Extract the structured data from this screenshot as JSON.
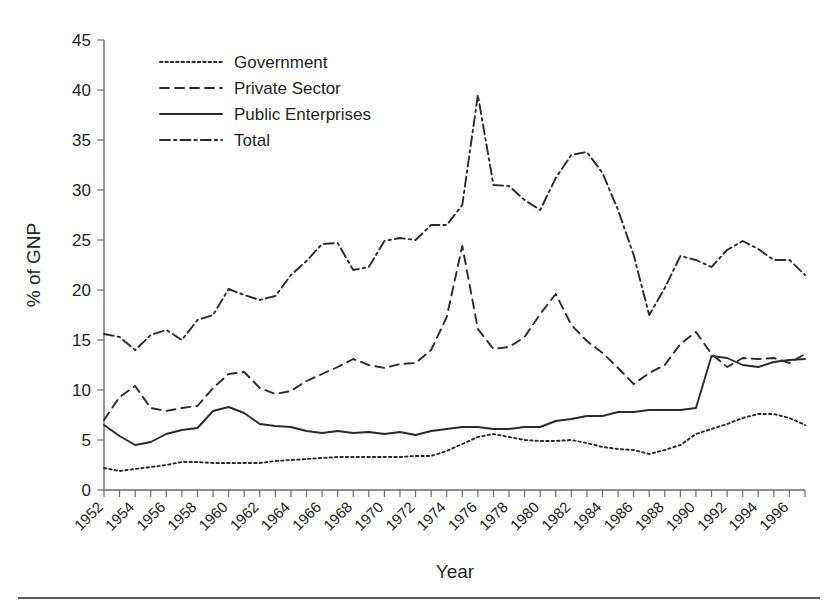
{
  "chart_data": {
    "type": "line",
    "title": "",
    "xlabel": "Year",
    "ylabel": "% of GNP",
    "xlim": [
      1952,
      1997
    ],
    "ylim": [
      0,
      45
    ],
    "yticks": [
      0,
      5,
      10,
      15,
      20,
      25,
      30,
      35,
      40,
      45
    ],
    "grid": false,
    "legend_position": "top-left-inside",
    "x": [
      1952,
      1953,
      1954,
      1955,
      1956,
      1957,
      1958,
      1959,
      1960,
      1961,
      1962,
      1963,
      1964,
      1965,
      1966,
      1967,
      1968,
      1969,
      1970,
      1971,
      1972,
      1973,
      1974,
      1975,
      1976,
      1977,
      1978,
      1979,
      1980,
      1981,
      1982,
      1983,
      1984,
      1985,
      1986,
      1987,
      1988,
      1989,
      1990,
      1991,
      1992,
      1993,
      1994,
      1995,
      1996,
      1997
    ],
    "xtick_labels": [
      "1952",
      "1954",
      "1956",
      "1958",
      "1960",
      "1962",
      "1964",
      "1966",
      "1968",
      "1970",
      "1972",
      "1974",
      "1976",
      "1978",
      "1980",
      "1982",
      "1984",
      "1986",
      "1988",
      "1990",
      "1992",
      "1994",
      "1996"
    ],
    "series": [
      {
        "name": "Government",
        "style": "dotted",
        "values": [
          2.2,
          1.9,
          2.1,
          2.3,
          2.5,
          2.8,
          2.8,
          2.7,
          2.7,
          2.7,
          2.7,
          2.9,
          3.0,
          3.1,
          3.2,
          3.3,
          3.3,
          3.3,
          3.3,
          3.3,
          3.4,
          3.4,
          3.9,
          4.6,
          5.3,
          5.6,
          5.3,
          5.0,
          4.9,
          4.9,
          5.0,
          4.7,
          4.3,
          4.1,
          4.0,
          3.6,
          4.0,
          4.5,
          5.6,
          6.1,
          6.6,
          7.2,
          7.6,
          7.6,
          7.2,
          6.5
        ]
      },
      {
        "name": "Private Sector",
        "style": "dashed",
        "values": [
          7.0,
          9.3,
          10.4,
          8.2,
          7.9,
          8.2,
          8.4,
          10.2,
          11.6,
          11.8,
          10.2,
          9.6,
          9.9,
          10.9,
          11.6,
          12.3,
          13.1,
          12.5,
          12.2,
          12.6,
          12.7,
          14.0,
          17.3,
          24.4,
          16.1,
          14.1,
          14.3,
          15.3,
          17.6,
          19.6,
          16.5,
          14.9,
          13.7,
          12.2,
          10.6,
          11.7,
          12.5,
          14.6,
          15.8,
          13.6,
          12.3,
          13.2,
          13.1,
          13.2,
          12.7,
          13.6
        ]
      },
      {
        "name": "Public Enterprises",
        "style": "solid",
        "values": [
          6.5,
          5.4,
          4.5,
          4.8,
          5.6,
          6.0,
          6.2,
          7.9,
          8.3,
          7.7,
          6.6,
          6.4,
          6.3,
          5.9,
          5.7,
          5.9,
          5.7,
          5.8,
          5.6,
          5.8,
          5.5,
          5.9,
          6.1,
          6.3,
          6.3,
          6.1,
          6.1,
          6.3,
          6.3,
          6.9,
          7.1,
          7.4,
          7.4,
          7.8,
          7.8,
          8.0,
          8.0,
          8.0,
          8.2,
          13.4,
          13.2,
          12.5,
          12.3,
          12.8,
          13.0,
          13.1
        ]
      },
      {
        "name": "Total",
        "style": "dash-dot",
        "values": [
          15.6,
          15.3,
          14.0,
          15.5,
          16.0,
          15.0,
          17.0,
          17.5,
          20.1,
          19.5,
          19.0,
          19.4,
          21.5,
          22.9,
          24.6,
          24.7,
          22.0,
          22.3,
          24.9,
          25.2,
          25.0,
          26.5,
          26.5,
          28.5,
          39.5,
          30.5,
          30.4,
          29.0,
          28.0,
          31.2,
          33.5,
          33.8,
          31.7,
          28.0,
          23.5,
          17.5,
          20.2,
          23.4,
          23.0,
          22.3,
          24.0,
          24.9,
          24.1,
          23.0,
          23.0,
          21.5
        ]
      }
    ],
    "series_values_public_enterprises_corrected": [
      6.5,
      5.4,
      4.5,
      4.8,
      5.6,
      6.0,
      6.2,
      7.9,
      8.3,
      7.7,
      6.6,
      6.4,
      6.3,
      5.9,
      5.7,
      5.9,
      5.7,
      5.8,
      5.6,
      5.8,
      5.5,
      5.9,
      6.1,
      6.3,
      6.3,
      6.1,
      6.1,
      6.3,
      6.3,
      6.9,
      7.1,
      7.4,
      7.4,
      7.8,
      7.8,
      8.0,
      8.0,
      8.0,
      8.2,
      13.4,
      13.2,
      12.5,
      12.3,
      12.8,
      13.0,
      13.1
    ]
  },
  "legend": {
    "items": [
      {
        "label": "Government",
        "style": "dotted"
      },
      {
        "label": "Private Sector",
        "style": "dashed"
      },
      {
        "label": "Public Enterprises",
        "style": "solid"
      },
      {
        "label": "Total",
        "style": "dash-dot"
      }
    ]
  },
  "axes": {
    "y_title": "% of GNP",
    "x_title": "Year",
    "y_tick_labels": [
      "45",
      "40",
      "35",
      "30",
      "25",
      "20",
      "15",
      "10",
      "5",
      "0"
    ]
  },
  "colors": {
    "line": "#2a2a2a",
    "axis": "#6b6b6b",
    "text": "#231f20",
    "background": "#ffffff",
    "rule": "#5a5a5a"
  }
}
